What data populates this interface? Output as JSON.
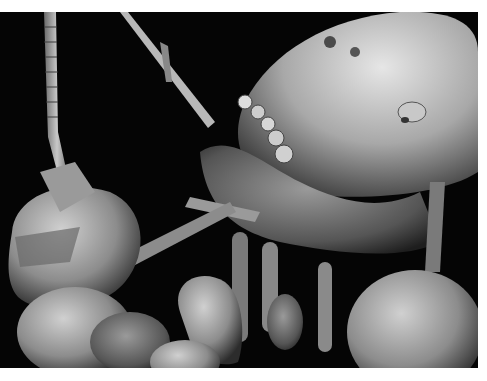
{
  "image": {
    "description": "Scanning electron micrograph of insects (termite/ant heads with segmented antennae, mandibles and legs) on black background",
    "colors": {
      "background": "#050505",
      "border": "#ffffff",
      "surface_light": "#d8d8d8",
      "surface_mid": "#8a8a8a",
      "surface_dark": "#3a3a3a"
    }
  }
}
